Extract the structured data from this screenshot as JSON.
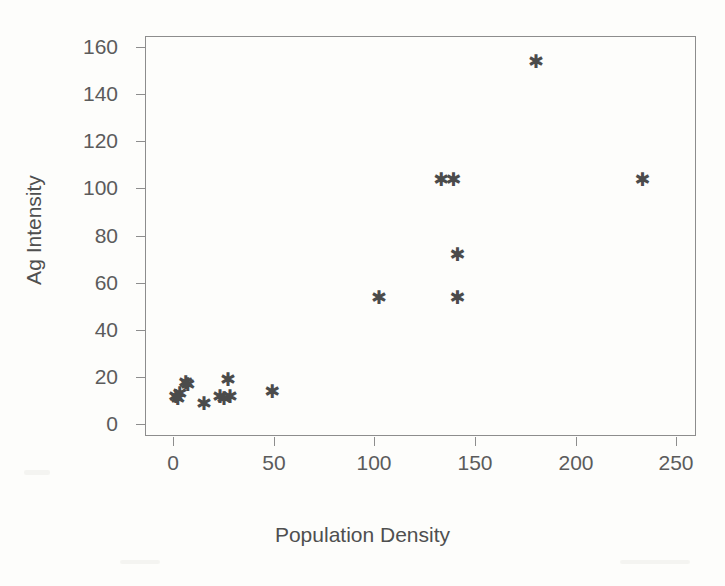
{
  "chart_data": {
    "type": "scatter",
    "title": "",
    "xlabel": "Population Density",
    "ylabel": "Ag Intensity",
    "xlim": [
      -10,
      260
    ],
    "ylim": [
      -6,
      170
    ],
    "xticks": [
      0,
      50,
      100,
      150,
      200,
      250
    ],
    "yticks": [
      0,
      20,
      40,
      60,
      80,
      100,
      120,
      140,
      160
    ],
    "grid": false,
    "legend": null,
    "marker": "star",
    "marker_color": "#4b4b4b",
    "points": [
      {
        "x": 1,
        "y": 12
      },
      {
        "x": 2,
        "y": 11
      },
      {
        "x": 3,
        "y": 13
      },
      {
        "x": 6,
        "y": 18
      },
      {
        "x": 7,
        "y": 17
      },
      {
        "x": 15,
        "y": 9
      },
      {
        "x": 23,
        "y": 12
      },
      {
        "x": 25,
        "y": 11
      },
      {
        "x": 27,
        "y": 19
      },
      {
        "x": 28,
        "y": 12
      },
      {
        "x": 49,
        "y": 14
      },
      {
        "x": 102,
        "y": 54
      },
      {
        "x": 133,
        "y": 104
      },
      {
        "x": 139,
        "y": 104
      },
      {
        "x": 141,
        "y": 72
      },
      {
        "x": 141,
        "y": 54
      },
      {
        "x": 180,
        "y": 154
      },
      {
        "x": 233,
        "y": 104
      }
    ]
  },
  "axes": {
    "x_tick_labels": [
      "0",
      "50",
      "100",
      "150",
      "200",
      "250"
    ],
    "y_tick_labels": [
      "0",
      "20",
      "40",
      "60",
      "80",
      "100",
      "120",
      "140",
      "160"
    ],
    "x_title": "Population Density",
    "y_title": "Ag Intensity"
  },
  "marker_glyph": "✱"
}
